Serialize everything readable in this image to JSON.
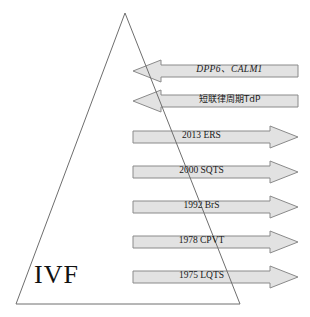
{
  "figure": {
    "title_label": "IVF",
    "triangle": {
      "name": "ivf-triangle",
      "apex": [
        125,
        13
      ],
      "base_left": [
        16,
        304
      ],
      "base_right": [
        240,
        304
      ],
      "stroke_color": "#6e6e6e"
    },
    "colors": {
      "arrow_fill": "#e2e2e2",
      "arrow_stroke": "#8a8a8a",
      "triangle_stroke": "#6e6e6e",
      "text": "#1a1a1a",
      "background": "#ffffff"
    },
    "arrows": [
      {
        "id": "arrow-dpp6-calm1",
        "label": "DPP6、CALM1",
        "direction": "left",
        "style": "italic",
        "x": 133,
        "y": 60,
        "width": 165,
        "height": 22,
        "head_width": 28,
        "shaft_inset": 5
      },
      {
        "id": "arrow-short-coupled-tdp",
        "label": "短联律周期TdP",
        "direction": "left",
        "style": "cjk",
        "x": 133,
        "y": 90,
        "width": 165,
        "height": 22,
        "head_width": 28,
        "shaft_inset": 5
      },
      {
        "id": "arrow-2013-ers",
        "label": "2013 ERS",
        "direction": "right",
        "style": "normal",
        "x": 133,
        "y": 126,
        "width": 165,
        "height": 22,
        "head_width": 28,
        "shaft_inset": 5
      },
      {
        "id": "arrow-2000-sqts",
        "label": "2000 SQTS",
        "direction": "right",
        "style": "normal",
        "x": 133,
        "y": 161,
        "width": 165,
        "height": 22,
        "head_width": 28,
        "shaft_inset": 5
      },
      {
        "id": "arrow-1992-brs",
        "label": "1992 BrS",
        "direction": "right",
        "style": "normal",
        "x": 133,
        "y": 196,
        "width": 165,
        "height": 22,
        "head_width": 28,
        "shaft_inset": 5
      },
      {
        "id": "arrow-1978-cpvt",
        "label": "1978 CPVT",
        "direction": "right",
        "style": "normal",
        "x": 133,
        "y": 231,
        "width": 165,
        "height": 22,
        "head_width": 28,
        "shaft_inset": 5
      },
      {
        "id": "arrow-1975-lqts",
        "label": "1975 LQTS",
        "direction": "right",
        "style": "normal",
        "x": 133,
        "y": 266,
        "width": 165,
        "height": 22,
        "head_width": 28,
        "shaft_inset": 5
      }
    ]
  }
}
